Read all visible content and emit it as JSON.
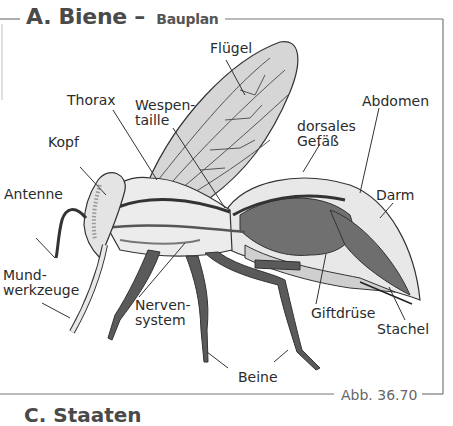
{
  "figure": {
    "section_letter": "A.",
    "title": "Biene",
    "title_separator": "–",
    "subtitle": "Bauplan",
    "caption": "Abb. 36.70",
    "next_section_partial": "C. Staaten"
  },
  "labels": {
    "fluegel": "Flügel",
    "thorax": "Thorax",
    "wespentaille": "Wespen-\ntaille",
    "kopf": "Kopf",
    "abdomen": "Abdomen",
    "dorsales_gefaess": "dorsales\nGefäß",
    "antenne": "Antenne",
    "darm": "Darm",
    "mundwerkzeuge": "Mund-\nwerkzeuge",
    "nervensystem": "Nerven-\nsystem",
    "giftdruese": "Giftdrüse",
    "stachel": "Stachel",
    "beine": "Beine"
  },
  "colors": {
    "frame": "#666666",
    "body_light": "#e6e6e6",
    "body_mid": "#c8c8c8",
    "organ_dark": "#6e6e6e",
    "legs": "#555555",
    "label_text": "#2b2b2b"
  }
}
